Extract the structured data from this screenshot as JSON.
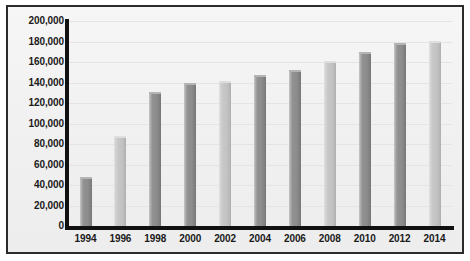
{
  "chart_data": {
    "type": "bar",
    "title": "",
    "subtitle": "",
    "xlabel": "",
    "ylabel": "",
    "categories": [
      "1994",
      "1996",
      "1998",
      "2000",
      "2002",
      "2004",
      "2006",
      "2008",
      "2010",
      "2012",
      "2014"
    ],
    "values": [
      48000,
      88000,
      131000,
      140000,
      142000,
      147000,
      152000,
      161000,
      170000,
      179000,
      181000
    ],
    "series": [
      {
        "name": "",
        "values": [
          48000,
          88000,
          131000,
          140000,
          142000,
          147000,
          152000,
          161000,
          170000,
          179000,
          181000
        ]
      }
    ],
    "ylim": [
      0,
      200000
    ],
    "ytick_values": [
      0,
      20000,
      40000,
      60000,
      80000,
      100000,
      120000,
      140000,
      160000,
      180000,
      200000
    ],
    "ytick_labels": [
      "0",
      "20,000",
      "40,000",
      "60,000",
      "80,000",
      "100,000",
      "120,000",
      "140,000",
      "160,000",
      "180,000",
      "200,000"
    ],
    "xtick_labels": [
      "1994",
      "1996",
      "1998",
      "2000",
      "2002",
      "2004",
      "2006",
      "2008",
      "2010",
      "2012",
      "2014"
    ],
    "grid": true,
    "grid_axis": "y",
    "legend": false,
    "legend_position": "none",
    "annotations": [],
    "bar_colors": [
      "#8d8d8d",
      "#c3c3c3",
      "#8d8d8d",
      "#8d8d8d",
      "#c3c3c3",
      "#8d8d8d",
      "#8d8d8d",
      "#c3c3c3",
      "#8d8d8d",
      "#8d8d8d",
      "#c3c3c3"
    ],
    "palette": {
      "bar_dark": "#8d8d8d",
      "bar_light": "#c3c3c3",
      "axis": "#111111",
      "grid": "#e4e4e4",
      "panel_background": "#f2f2f2",
      "frame_border": "#2b2b2b",
      "text": "#1a1a1a"
    }
  }
}
